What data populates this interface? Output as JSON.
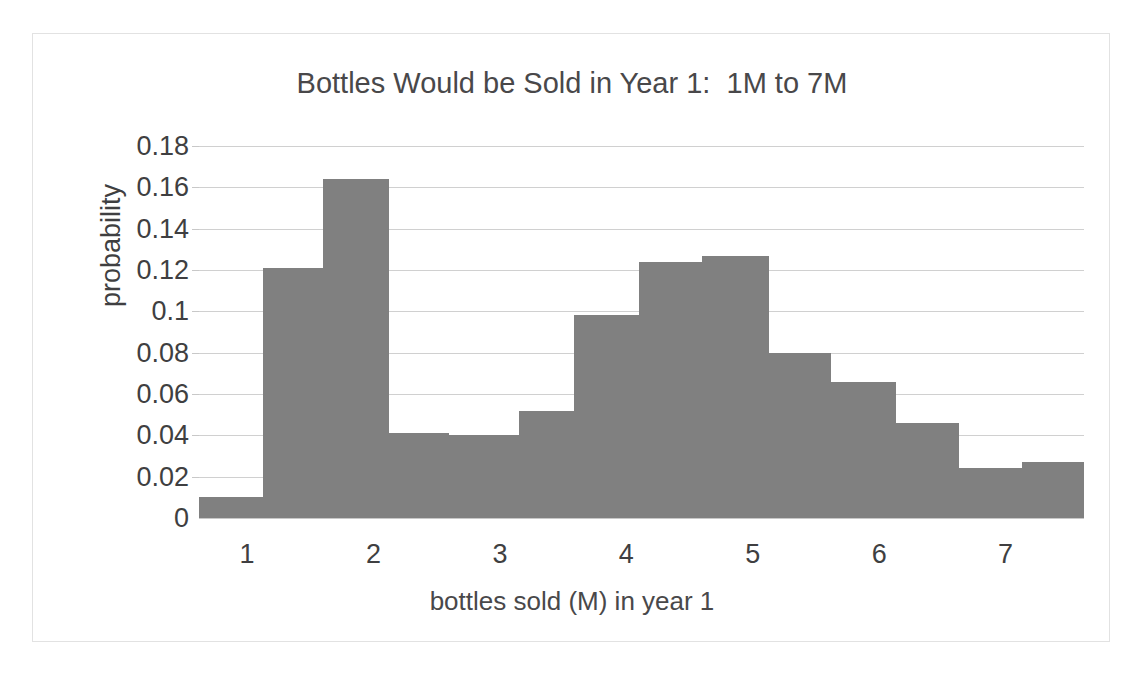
{
  "chart_data": {
    "type": "bar",
    "title": "Bottles Would be Sold in Year 1:  1M to 7M",
    "subtitle": "",
    "xlabel": "bottles sold (M) in year 1",
    "ylabel": "probability",
    "grid": true,
    "legend": null,
    "xlim": [
      0.62,
      7.62
    ],
    "ylim": [
      0,
      0.18
    ],
    "xticks": [
      1,
      2,
      3,
      4,
      5,
      6,
      7
    ],
    "xtick_labels": [
      "1",
      "2",
      "3",
      "4",
      "5",
      "6",
      "7"
    ],
    "yticks": [
      0,
      0.02,
      0.04,
      0.06,
      0.08,
      0.1,
      0.12,
      0.14,
      0.16,
      0.18
    ],
    "ytick_labels": [
      "0",
      "0.02",
      "0.04",
      "0.06",
      "0.08",
      "0.1",
      "0.12",
      "0.14",
      "0.16",
      "0.18"
    ],
    "bar_color": "#808080",
    "bin_edges": [
      0.62,
      1.13,
      1.6,
      2.12,
      2.6,
      3.15,
      3.59,
      4.1,
      4.6,
      5.13,
      5.62,
      6.13,
      6.63,
      7.13,
      7.62
    ],
    "bins": [
      {
        "x_start": 0.62,
        "x_end": 1.13,
        "value": 0.01
      },
      {
        "x_start": 1.13,
        "x_end": 1.6,
        "value": 0.121
      },
      {
        "x_start": 1.6,
        "x_end": 2.12,
        "value": 0.164
      },
      {
        "x_start": 2.12,
        "x_end": 2.6,
        "value": 0.041
      },
      {
        "x_start": 2.6,
        "x_end": 3.15,
        "value": 0.04
      },
      {
        "x_start": 3.15,
        "x_end": 3.59,
        "value": 0.052
      },
      {
        "x_start": 3.59,
        "x_end": 4.1,
        "value": 0.098
      },
      {
        "x_start": 4.1,
        "x_end": 4.6,
        "value": 0.124
      },
      {
        "x_start": 4.6,
        "x_end": 5.13,
        "value": 0.127
      },
      {
        "x_start": 5.13,
        "x_end": 5.62,
        "value": 0.08
      },
      {
        "x_start": 5.62,
        "x_end": 6.13,
        "value": 0.066
      },
      {
        "x_start": 6.13,
        "x_end": 6.63,
        "value": 0.046
      },
      {
        "x_start": 6.63,
        "x_end": 7.13,
        "value": 0.024
      },
      {
        "x_start": 7.13,
        "x_end": 7.62,
        "value": 0.027
      }
    ],
    "values": [
      0.01,
      0.121,
      0.164,
      0.041,
      0.04,
      0.052,
      0.098,
      0.124,
      0.127,
      0.08,
      0.066,
      0.046,
      0.024,
      0.027
    ],
    "categories": [
      "0.6-1.1",
      "1.1-1.6",
      "1.6-2.1",
      "2.1-2.6",
      "2.6-3.2",
      "3.2-3.6",
      "3.6-4.1",
      "4.1-4.6",
      "4.6-5.1",
      "5.1-5.6",
      "5.6-6.1",
      "6.1-6.6",
      "6.6-7.1",
      "7.1-7.6"
    ]
  },
  "colors": {
    "bar": "#808080",
    "gridline": "#d0d0d0",
    "frame": "#e2e2e2",
    "text": "#3f3f41",
    "title_text": "#49484a"
  }
}
